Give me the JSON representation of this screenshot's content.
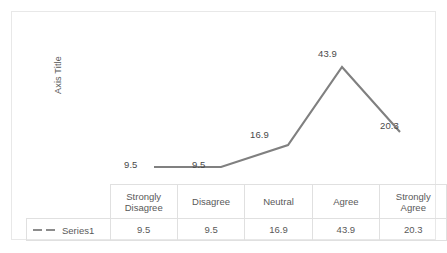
{
  "chart_data": {
    "type": "line",
    "title": "",
    "subtitle": "",
    "xlabel": "",
    "ylabel": "Axis Title",
    "categories": [
      "Strongly Disagree",
      "Disagree",
      "Neutral",
      "Agree",
      "Strongly Agree"
    ],
    "series": [
      {
        "name": "Series1",
        "values": [
          9.5,
          9.5,
          16.9,
          43.9,
          20.3
        ],
        "color": "#808080",
        "line_style": "solid",
        "markers": "none",
        "data_labels": [
          "9.5",
          "9.5",
          "16.9",
          "43.9",
          "20.3"
        ]
      }
    ],
    "ylim": [
      0,
      48
    ],
    "grid": false,
    "legend_position": "data-table",
    "has_data_table": true,
    "axis_ticks_visible": false
  },
  "plot": {
    "axis_title": "Axis Title",
    "labels": [
      {
        "text": "9.5",
        "x": 112,
        "y": 147
      },
      {
        "text": "9.5",
        "x": 180,
        "y": 147
      },
      {
        "text": "16.9",
        "x": 238,
        "y": 117
      },
      {
        "text": "43.9",
        "x": 306,
        "y": 36
      },
      {
        "text": "20.3",
        "x": 368,
        "y": 108
      }
    ],
    "points": [
      {
        "x": 142,
        "y": 155
      },
      {
        "x": 209,
        "y": 155
      },
      {
        "x": 276,
        "y": 133
      },
      {
        "x": 330,
        "y": 55
      },
      {
        "x": 388,
        "y": 120
      }
    ]
  },
  "table": {
    "legend_label": "Series1",
    "headers": [
      "Strongly Disagree",
      "Disagree",
      "Neutral",
      "Agree",
      "Strongly Agree"
    ],
    "header_lines": [
      [
        "Strongly",
        "Disagree"
      ],
      [
        "Disagree"
      ],
      [
        "Neutral"
      ],
      [
        "Agree"
      ],
      [
        "Strongly",
        "Agree"
      ]
    ],
    "values": [
      "9.5",
      "9.5",
      "16.9",
      "43.9",
      "20.3"
    ]
  },
  "colors": {
    "series_line": "#808080",
    "label_text": "#4a4a4a",
    "table_border": "#e0e0e0",
    "chart_border": "#e8e8e8",
    "background": "#ffffff"
  }
}
